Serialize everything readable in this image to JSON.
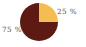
{
  "chart_data": {
    "type": "pie",
    "title": "",
    "subtitle": "",
    "xlabel": "",
    "ylabel": "",
    "grid": false,
    "legend": "none",
    "label_suffix": "%",
    "start_angle_deg": 0,
    "direction": "clockwise",
    "center": {
      "x": 39,
      "y": 22
    },
    "radius": 19,
    "categories": [
      "25 %",
      "75 %"
    ],
    "values": [
      25,
      75
    ],
    "colors": [
      "#F5BC52",
      "#5C1A12"
    ],
    "slices": [
      {
        "label": "25 %",
        "value": 25,
        "color": "#F5BC52",
        "start_deg": 0,
        "end_deg": 90,
        "label_position": "upper-right"
      },
      {
        "label": "75 %",
        "value": 75,
        "color": "#5C1A12",
        "start_deg": 90,
        "end_deg": 360,
        "label_position": "lower-left"
      }
    ],
    "annotations": [],
    "background_color": "#FFFFFF",
    "label_color": "#4A4A4A"
  }
}
